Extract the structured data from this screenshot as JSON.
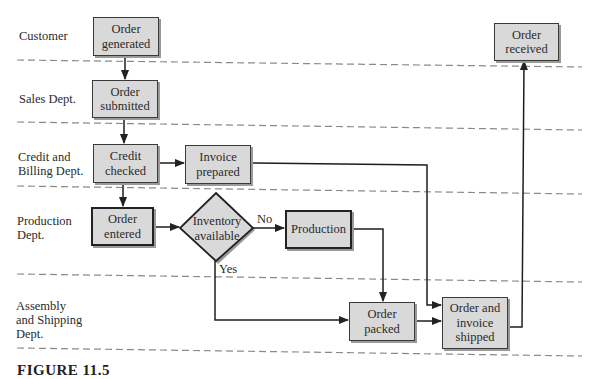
{
  "diagram": {
    "type": "swimlane-flowchart",
    "lanes": [
      {
        "label": "Customer"
      },
      {
        "label": "Sales Dept."
      },
      {
        "label": "Credit and\nBilling Dept."
      },
      {
        "label": "Production\nDept."
      },
      {
        "label": "Assembly\nand Shipping\nDept."
      }
    ],
    "nodes": [
      {
        "id": "order-generated",
        "label": "Order\ngenerated",
        "lane": "Customer",
        "shape": "box"
      },
      {
        "id": "order-submitted",
        "label": "Order\nsubmitted",
        "lane": "Sales Dept.",
        "shape": "box"
      },
      {
        "id": "credit-checked",
        "label": "Credit\nchecked",
        "lane": "Credit and Billing Dept.",
        "shape": "box"
      },
      {
        "id": "invoice-prepared",
        "label": "Invoice\nprepared",
        "lane": "Credit and Billing Dept.",
        "shape": "box"
      },
      {
        "id": "order-entered",
        "label": "Order\nentered",
        "lane": "Production Dept.",
        "shape": "box"
      },
      {
        "id": "inventory-available",
        "label": "Inventory\navailable",
        "lane": "Production Dept.",
        "shape": "diamond"
      },
      {
        "id": "production",
        "label": "Production",
        "lane": "Production Dept.",
        "shape": "box"
      },
      {
        "id": "order-packed",
        "label": "Order\npacked",
        "lane": "Assembly and Shipping Dept.",
        "shape": "box"
      },
      {
        "id": "order-invoice-shipped",
        "label": "Order and\ninvoice\nshipped",
        "lane": "Assembly and Shipping Dept.",
        "shape": "box"
      },
      {
        "id": "order-received",
        "label": "Order\nreceived",
        "lane": "Customer",
        "shape": "box"
      }
    ],
    "edges": [
      {
        "from": "order-generated",
        "to": "order-submitted",
        "label": ""
      },
      {
        "from": "order-submitted",
        "to": "credit-checked",
        "label": ""
      },
      {
        "from": "credit-checked",
        "to": "invoice-prepared",
        "label": ""
      },
      {
        "from": "credit-checked",
        "to": "order-entered",
        "label": ""
      },
      {
        "from": "order-entered",
        "to": "inventory-available",
        "label": ""
      },
      {
        "from": "inventory-available",
        "to": "production",
        "label": "No"
      },
      {
        "from": "inventory-available",
        "to": "order-packed",
        "label": "Yes"
      },
      {
        "from": "production",
        "to": "order-packed",
        "label": ""
      },
      {
        "from": "invoice-prepared",
        "to": "order-invoice-shipped",
        "label": ""
      },
      {
        "from": "order-packed",
        "to": "order-invoice-shipped",
        "label": ""
      },
      {
        "from": "order-invoice-shipped",
        "to": "order-received",
        "label": ""
      }
    ],
    "edge_labels": {
      "no": "No",
      "yes": "Yes"
    },
    "caption": "FIGURE 11.5"
  }
}
